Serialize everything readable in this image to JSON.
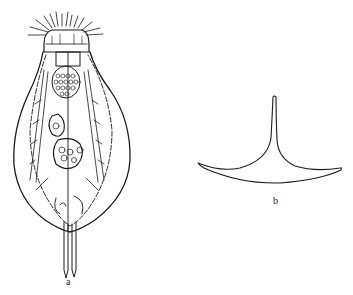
{
  "figure": {
    "panels": [
      {
        "id": "a",
        "label": "a",
        "subject": "rotifer-body-illustration"
      },
      {
        "id": "b",
        "label": "b",
        "subject": "spine-outline-illustration"
      }
    ],
    "colors": {
      "ink": "#1a1a1a",
      "background": "#ffffff"
    }
  }
}
